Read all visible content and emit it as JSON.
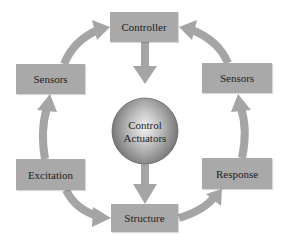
{
  "diagram": {
    "title": "",
    "nodes": {
      "controller": "Controller",
      "sensors_left": "Sensors",
      "sensors_right": "Sensors",
      "excitation": "Excitation",
      "response": "Response",
      "structure": "Structure",
      "actuators_line1": "Control",
      "actuators_line2": "Actuators"
    },
    "edges": [
      {
        "from": "Sensors (left)",
        "to": "Controller"
      },
      {
        "from": "Sensors (right)",
        "to": "Controller"
      },
      {
        "from": "Controller",
        "to": "Control Actuators"
      },
      {
        "from": "Control Actuators",
        "to": "Structure"
      },
      {
        "from": "Excitation",
        "to": "Sensors (left)"
      },
      {
        "from": "Excitation",
        "to": "Structure"
      },
      {
        "from": "Structure",
        "to": "Response"
      },
      {
        "from": "Response",
        "to": "Sensors (right)"
      }
    ],
    "colors": {
      "box_fill": "#a9a9a9",
      "arrow": "#a5a5a5",
      "text": "#1e1e1e",
      "background": "#ffffff"
    }
  }
}
